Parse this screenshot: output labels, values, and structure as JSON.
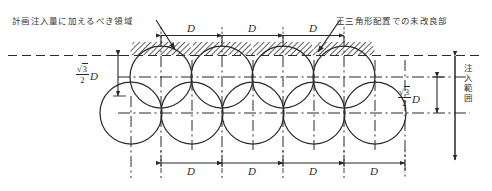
{
  "figure": {
    "kind": "engineering-diagram",
    "ink_color": "#2b2a28",
    "background_color": "#ffffff",
    "hatch_color": "#2b2a28"
  },
  "annotations": {
    "top_left_label": "計画注入量に加えるべき領域",
    "top_right_label": "正三角形配置での未改良部",
    "right_vertical_label": "注入範囲"
  },
  "dimensions": {
    "diameter_symbol": "D",
    "top_row_spans": [
      "D",
      "D",
      "D"
    ],
    "bottom_row_spans": [
      "D",
      "D",
      "D",
      "D"
    ],
    "vertical_left": {
      "radical": "√3",
      "numerator": "3",
      "denominator": "2",
      "symbol": "D",
      "reading": "(√3/2)D"
    },
    "vertical_right": {
      "radical": "√3",
      "numerator": "3",
      "denominator": "2",
      "symbol": "D",
      "reading": "(√3/2)D"
    }
  },
  "geometry": {
    "circle_radius": 31,
    "top_row_circle_count": 4,
    "bottom_row_circle_count": 5,
    "top_row_center_y": 77,
    "bottom_row_center_y": 113,
    "top_row_centers_x": [
      161,
      222,
      283,
      344
    ],
    "bottom_row_centers_x": [
      161,
      222,
      283,
      344,
      405
    ],
    "bottom_row_offset_x": 131,
    "top_tangent_line_y": 55,
    "hatched_cap_count": 4
  }
}
